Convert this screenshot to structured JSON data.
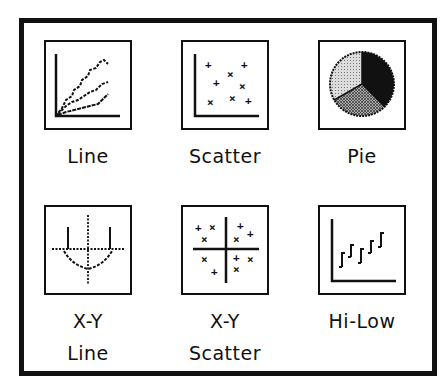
{
  "dialog": {
    "chart_types": [
      {
        "id": "line",
        "label": "Line",
        "icon": "line-chart-icon"
      },
      {
        "id": "scatter",
        "label": "Scatter",
        "icon": "scatter-chart-icon"
      },
      {
        "id": "pie",
        "label": "Pie",
        "icon": "pie-chart-icon"
      },
      {
        "id": "xy-line",
        "label_line1": "X-Y",
        "label_line2": "Line",
        "icon": "xy-line-chart-icon"
      },
      {
        "id": "xy-scatter",
        "label_line1": "X-Y",
        "label_line2": "Scatter",
        "icon": "xy-scatter-chart-icon"
      },
      {
        "id": "hi-low",
        "label": "Hi-Low",
        "icon": "hi-low-chart-icon"
      }
    ]
  },
  "colors": {
    "ink": "#111111",
    "background": "#ffffff"
  }
}
